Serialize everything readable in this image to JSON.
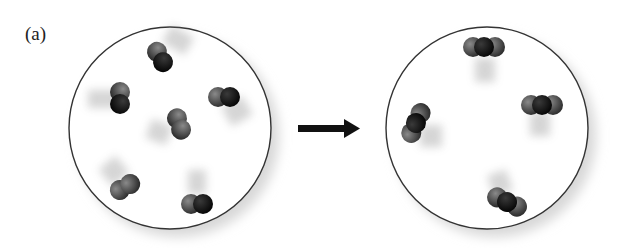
{
  "figure": {
    "panel_label": "(a)",
    "colors": {
      "background": "#ffffff",
      "container_outline": "#333333",
      "atom_light": "#5a5a5a",
      "atom_dark": "#161616",
      "arrow": "#111111"
    },
    "left_container": {
      "label": "reactants",
      "center": [
        170,
        128
      ],
      "radius": 101,
      "molecules": [
        {
          "type": "diatomic",
          "x": 160,
          "y": 57,
          "angle": 60
        },
        {
          "type": "diatomic",
          "x": 120,
          "y": 98,
          "angle": 90
        },
        {
          "type": "diatomic",
          "x": 224,
          "y": 97,
          "angle": 0
        },
        {
          "type": "diatomic",
          "x": 179,
          "y": 124,
          "angle": 70
        },
        {
          "type": "diatomic",
          "x": 125,
          "y": 187,
          "angle": -30
        },
        {
          "type": "diatomic",
          "x": 197,
          "y": 204,
          "angle": 0
        }
      ]
    },
    "arrow": {
      "from": [
        298,
        128
      ],
      "to": [
        360,
        128
      ]
    },
    "right_container": {
      "label": "products",
      "center": [
        487,
        128
      ],
      "radius": 101,
      "molecules": [
        {
          "type": "triatomic",
          "x": 484,
          "y": 47,
          "angle": 0
        },
        {
          "type": "triatomic",
          "x": 416,
          "y": 123,
          "angle": -65
        },
        {
          "type": "triatomic",
          "x": 542,
          "y": 105,
          "angle": 0
        },
        {
          "type": "triatomic",
          "x": 507,
          "y": 202,
          "angle": 25
        }
      ]
    }
  }
}
